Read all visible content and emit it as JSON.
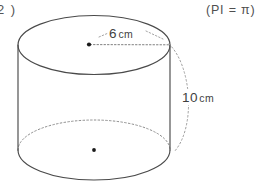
{
  "figure": {
    "problem_number": "2 )",
    "pi_note": "(PI = π)",
    "shape": "cylinder",
    "radius": {
      "value": "6",
      "unit": "cm",
      "line_style": "dotted",
      "from": "top-center-dot",
      "to": "top-rim-right"
    },
    "height": {
      "value": "10",
      "unit": "cm",
      "line_style": "dotted",
      "from": "top-rim-right",
      "to": "bottom-rim-right"
    },
    "center_dots": [
      {
        "name": "top-center-dot",
        "x": 89,
        "y": 44
      },
      {
        "name": "bottom-center-dot",
        "x": 94,
        "y": 150
      }
    ],
    "colors": {
      "stroke": "#4a4a4a",
      "dotted": "#8a8a8a",
      "background": "#ffffff",
      "dot_fill": "#1a1a1a"
    }
  }
}
